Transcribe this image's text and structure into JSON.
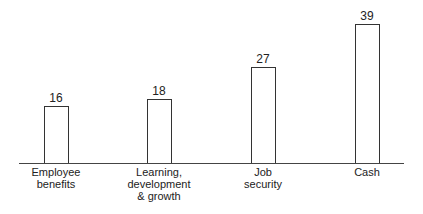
{
  "chart_data": {
    "type": "bar",
    "title": "",
    "xlabel": "",
    "ylabel": "",
    "categories": [
      "Employee\nbenefits",
      "Learning,\ndevelopment\n& growth",
      "Job\nsecurity",
      "Cash"
    ],
    "values": [
      16,
      18,
      27,
      39
    ],
    "value_labels": [
      "16",
      "18",
      "27",
      "39"
    ],
    "ylim": [
      0,
      40
    ],
    "grid": false,
    "legend": null,
    "bar_fill": "#ffffff",
    "bar_stroke": "#333333"
  }
}
